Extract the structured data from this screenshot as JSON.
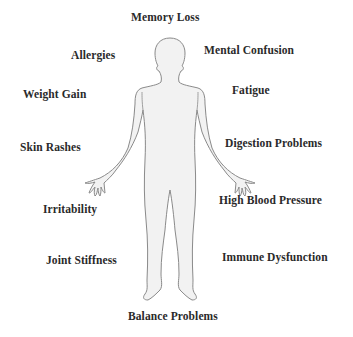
{
  "diagram": {
    "title": "",
    "figure": "human-body-silhouette",
    "colors": {
      "body_fill": "#f2f2f2",
      "body_outline": "#8a8a8a",
      "text": "#2a2a2a",
      "background": "#ffffff"
    },
    "labels": {
      "memory_loss": "Memory Loss",
      "allergies": "Allergies",
      "mental_confusion": "Mental Confusion",
      "weight_gain": "Weight Gain",
      "fatigue": "Fatigue",
      "skin_rashes": "Skin Rashes",
      "digestion_problems": "Digestion Problems",
      "irritability": "Irritability",
      "high_blood_pressure": "High Blood Pressure",
      "joint_stiffness": "Joint Stiffness",
      "immune_dysfunction": "Immune Dysfunction",
      "balance_problems": "Balance Problems"
    }
  }
}
